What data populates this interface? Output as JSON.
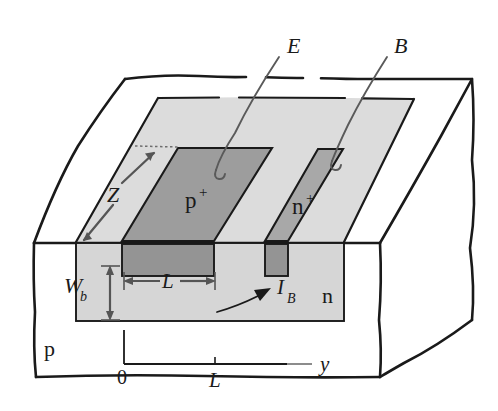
{
  "figure": {
    "name": "lateral-bjt-3d-cutaway"
  },
  "colors": {
    "ink": "#1a1a1a",
    "substrate_fill": "#ffffff",
    "n_region_fill": "#d6d6d6",
    "n_region_top_fill": "#dcdcdc",
    "pplus_fill": "#9d9d9d",
    "nplus_fill": "#a8a8a8",
    "pplus_front_fill": "#949494",
    "dim_arrow": "#555555"
  },
  "callouts": [
    {
      "id": "emitter",
      "label": "E"
    },
    {
      "id": "base",
      "label": "B"
    }
  ],
  "region_labels": [
    {
      "id": "pplus",
      "label": "p",
      "sup": "+"
    },
    {
      "id": "nplus",
      "label": "n",
      "sup": "+"
    },
    {
      "id": "n-base",
      "label": "n",
      "sup": ""
    },
    {
      "id": "p-substrate",
      "label": "p",
      "sup": ""
    }
  ],
  "dimensions": [
    {
      "id": "Z",
      "label": "Z",
      "sub": "",
      "kind": "double-arrow",
      "orientation": "depth"
    },
    {
      "id": "Wb",
      "label": "W",
      "sub": "b",
      "kind": "double-arrow",
      "orientation": "vertical"
    },
    {
      "id": "L",
      "label": "L",
      "sub": "",
      "kind": "double-arrow",
      "orientation": "horizontal"
    }
  ],
  "currents": [
    {
      "id": "IB",
      "label": "I",
      "sub": "B",
      "kind": "curved-arrow"
    }
  ],
  "axis": {
    "name": "y-axis",
    "axis_label": "y",
    "ticks": [
      {
        "value": "0",
        "position": "origin"
      },
      {
        "value": "L",
        "position": "mid"
      }
    ]
  }
}
